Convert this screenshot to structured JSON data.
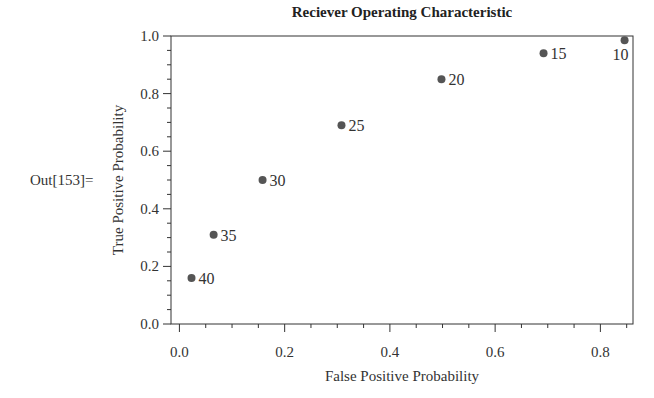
{
  "cell": {
    "out_label": "Out[153]="
  },
  "chart_data": {
    "type": "scatter",
    "title": "Reciever Operating Characteristic",
    "xlabel": "False Positive Probability",
    "ylabel": "True Positive Probability",
    "xlim": [
      -0.016,
      0.862
    ],
    "ylim": [
      0.0,
      1.0
    ],
    "x_ticks": [
      0.0,
      0.2,
      0.4,
      0.6,
      0.8
    ],
    "x_tick_labels": [
      "0.0",
      "0.2",
      "0.4",
      "0.6",
      "0.8"
    ],
    "y_ticks": [
      0.0,
      0.2,
      0.4,
      0.6,
      0.8,
      1.0
    ],
    "y_tick_labels": [
      "0.0",
      "0.2",
      "0.4",
      "0.6",
      "0.8",
      "1.0"
    ],
    "grid": false,
    "legend": null,
    "points": [
      {
        "label": "40",
        "x": 0.023,
        "y": 0.16
      },
      {
        "label": "35",
        "x": 0.065,
        "y": 0.31
      },
      {
        "label": "30",
        "x": 0.158,
        "y": 0.5
      },
      {
        "label": "25",
        "x": 0.308,
        "y": 0.69
      },
      {
        "label": "20",
        "x": 0.498,
        "y": 0.85
      },
      {
        "label": "15",
        "x": 0.692,
        "y": 0.94
      },
      {
        "label": "10",
        "x": 0.846,
        "y": 0.985
      }
    ],
    "colors": {
      "point": "#555555",
      "axis": "#333333",
      "text": "#333333"
    }
  }
}
